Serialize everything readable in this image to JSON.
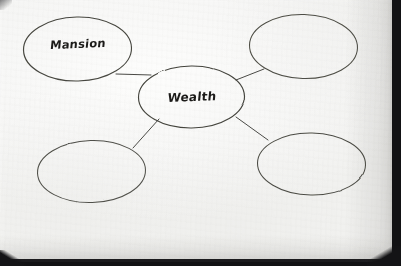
{
  "scene": {
    "medium": "hand-drawn ink on paper, photographed",
    "paper_color": "#f8f8f6",
    "ink_color": "#3a3a38",
    "background_color": "#141416"
  },
  "diagram": {
    "type": "bubble-concept-map",
    "center": {
      "id": "center",
      "label": "Wealth",
      "cx": 191.5,
      "cy": 97,
      "rx": 53,
      "ry": 31,
      "filled": true
    },
    "branches": [
      {
        "id": "branch-top-left",
        "label": "Mansion",
        "cx": 77.5,
        "cy": 49,
        "rx": 54,
        "ry": 32,
        "filled": true
      },
      {
        "id": "branch-top-right",
        "label": "",
        "cx": 303.5,
        "cy": 46.5,
        "rx": 54,
        "ry": 32,
        "filled": false
      },
      {
        "id": "branch-bottom-left",
        "label": "",
        "cx": 91.5,
        "cy": 171.5,
        "rx": 54,
        "ry": 31,
        "filled": false
      },
      {
        "id": "branch-bottom-right",
        "label": "",
        "cx": 311.5,
        "cy": 164,
        "rx": 54,
        "ry": 31,
        "filled": false
      }
    ],
    "connectors": [
      {
        "id": "connector-center-to-top-left",
        "from": "center",
        "to": "branch-top-left",
        "x1": 151,
        "y1": 75,
        "x2": 116,
        "y2": 74
      },
      {
        "id": "connector-center-to-top-right",
        "from": "center",
        "to": "branch-top-right",
        "x1": 236,
        "y1": 80,
        "x2": 264,
        "y2": 69
      },
      {
        "id": "connector-center-to-bottom-left",
        "from": "center",
        "to": "branch-bottom-left",
        "x1": 159,
        "y1": 119,
        "x2": 133,
        "y2": 148
      },
      {
        "id": "connector-center-to-bottom-right",
        "from": "center",
        "to": "branch-bottom-right",
        "x1": 236,
        "y1": 117,
        "x2": 268,
        "y2": 140
      }
    ]
  }
}
